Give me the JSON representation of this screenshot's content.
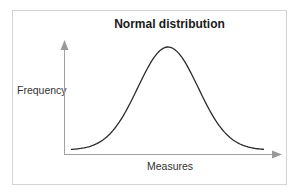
{
  "chart_data": {
    "type": "line",
    "title": "Normal distribution",
    "xlabel": "Measures",
    "ylabel": "Frequency",
    "grid": false,
    "legend": null,
    "x": [
      -3,
      -2.5,
      -2,
      -1.5,
      -1,
      -0.5,
      0,
      0.5,
      1,
      1.5,
      2,
      2.5,
      3
    ],
    "values": [
      0.004,
      0.018,
      0.054,
      0.13,
      0.242,
      0.352,
      0.399,
      0.352,
      0.242,
      0.13,
      0.054,
      0.018,
      0.004
    ]
  },
  "diagram": {
    "title": "Normal distribution",
    "y_axis_label": "Frequency",
    "x_axis_label": "Measures",
    "colors": {
      "curve": "#2b2b2b",
      "axes": "#9a9a9a",
      "frame": "#d4d4d4"
    }
  }
}
